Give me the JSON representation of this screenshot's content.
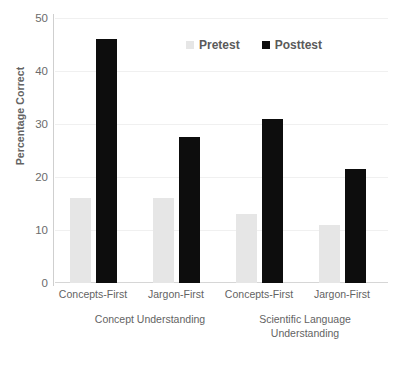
{
  "chart_data": {
    "type": "bar",
    "title": "",
    "xlabel": "",
    "ylabel": "Percentage Correct",
    "ylim": [
      0,
      50
    ],
    "yticks": [
      0,
      10,
      20,
      30,
      40,
      50
    ],
    "ytick_labels": [
      "0",
      "10",
      "20",
      "30",
      "40",
      "50"
    ],
    "grid": "horizontal",
    "legend_position": "top-center",
    "categories": [
      "Concepts-First",
      "Jargon-First",
      "Concepts-First",
      "Jargon-First"
    ],
    "group_labels": [
      "Concept Understanding",
      "Scientific Language Understanding"
    ],
    "groups": [
      {
        "name": "Concept Understanding",
        "categories": [
          "Concepts-First",
          "Jargon-First"
        ]
      },
      {
        "name": "Scientific Language Understanding",
        "categories": [
          "Concepts-First",
          "Jargon-First"
        ]
      }
    ],
    "series": [
      {
        "name": "Pretest",
        "color": "#e6e6e6",
        "values": [
          16,
          16,
          13,
          11
        ]
      },
      {
        "name": "Posttest",
        "color": "#0d0d0d",
        "values": [
          46,
          27.5,
          31,
          21.5
        ]
      }
    ],
    "legend": [
      {
        "label": "Pretest",
        "color": "#e6e6e6",
        "swatch": "square-swatch-light"
      },
      {
        "label": "Posttest",
        "color": "#0d0d0d",
        "swatch": "square-swatch-dark"
      }
    ]
  },
  "layout": {
    "bar_positions_px": [
      {
        "series": "Pretest",
        "left": 15,
        "width": 21
      },
      {
        "series": "Posttest",
        "left": 41,
        "width": 21
      },
      {
        "series": "Pretest",
        "left": 98,
        "width": 21
      },
      {
        "series": "Posttest",
        "left": 124,
        "width": 21
      },
      {
        "series": "Pretest",
        "left": 181,
        "width": 21
      },
      {
        "series": "Posttest",
        "left": 207,
        "width": 21
      },
      {
        "series": "Pretest",
        "left": 264,
        "width": 21
      },
      {
        "series": "Posttest",
        "left": 290,
        "width": 21
      }
    ],
    "x_label_centers_px": [
      38,
      121,
      204,
      287
    ],
    "group_label_centers_px": [
      110,
      265
    ]
  }
}
